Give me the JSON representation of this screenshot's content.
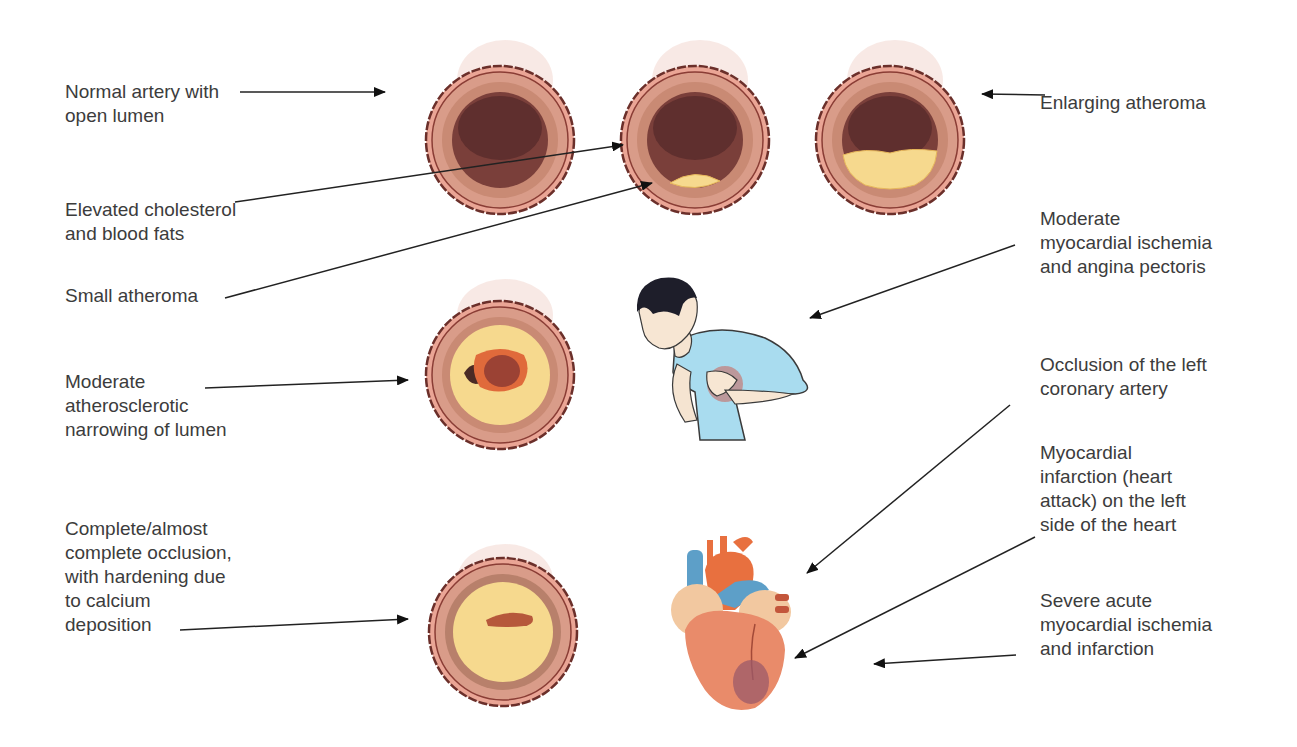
{
  "labels": {
    "normal_artery": "Normal artery with\nopen lumen",
    "elevated_cholesterol": "Elevated cholesterol\nand blood fats",
    "small_atheroma": "Small atheroma",
    "enlarging_atheroma": "Enlarging atheroma",
    "moderate_ischemia": "Moderate\nmyocardial ischemia\nand angina pectoris",
    "moderate_narrowing": "Moderate\natherosclerotic\nnarrowing of lumen",
    "occlusion_left_coronary": "Occlusion of the left\ncoronary artery",
    "myocardial_infarction": "Myocardial\ninfarction (heart\nattack) on the left\nside of the heart",
    "complete_occlusion": "Complete/almost\ncomplete occlusion,\nwith hardening due\nto calcium\ndeposition",
    "severe_ischemia": "Severe acute\nmyocardial ischemia\nand infarction"
  },
  "figures": {
    "artery_stages": [
      "normal",
      "small-atheroma",
      "enlarging-atheroma",
      "moderate-narrowing",
      "complete-occlusion"
    ],
    "person": "man clutching chest (angina)",
    "heart": "heart with infarct region on left ventricle"
  },
  "colors": {
    "outer_wall": "#e8a08f",
    "wall_outline": "#6b2f2a",
    "media": "#c98a74",
    "intima": "#b06d5a",
    "lumen": "#7a3f3a",
    "lumen_dark": "#5f2f2e",
    "plaque": "#f6d98e",
    "calcified": "#f4d38a",
    "shirt": "#a9dcef",
    "heart": "#e98b6a",
    "aorta": "#e8703f",
    "vein": "#5d9fc8",
    "infarct": "#9b5a6a"
  }
}
